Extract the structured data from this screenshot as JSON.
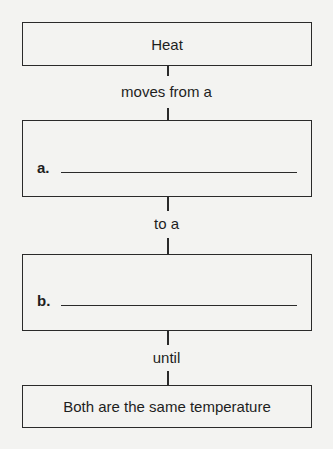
{
  "diagram": {
    "type": "flowchart",
    "direction": "top-to-bottom",
    "nodes": [
      {
        "id": "heat",
        "text": "Heat",
        "kind": "box"
      },
      {
        "id": "a",
        "label": "a.",
        "kind": "fill-in-blank",
        "value": ""
      },
      {
        "id": "b",
        "label": "b.",
        "kind": "fill-in-blank",
        "value": ""
      },
      {
        "id": "result",
        "text": "Both are the same temperature",
        "kind": "box"
      }
    ],
    "connectors": [
      {
        "from": "heat",
        "to": "a",
        "label": "moves from a"
      },
      {
        "from": "a",
        "to": "b",
        "label": "to a"
      },
      {
        "from": "b",
        "to": "result",
        "label": "until"
      }
    ]
  },
  "colors": {
    "background": "#f3f3f1",
    "line": "#2a2a2a",
    "text": "#1e1e1e"
  }
}
